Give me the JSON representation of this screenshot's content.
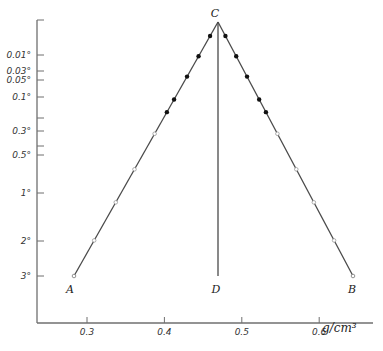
{
  "chart_data": {
    "type": "line",
    "title": "",
    "xlabel": "g/cm³",
    "ylabel": "",
    "xlim": [
      0.235,
      0.67
    ],
    "x_ticks": [
      0.3,
      0.4,
      0.5,
      0.6
    ],
    "x_tick_labels": [
      "0.3",
      "0.4",
      "0.5",
      "0.6"
    ],
    "y_ticks_labeled": [
      {
        "label": "0.01°",
        "value": 0.01
      },
      {
        "label": "0.03°",
        "value": 0.03
      },
      {
        "label": "0.05°",
        "value": 0.05
      },
      {
        "label": "0.1°",
        "value": 0.1
      },
      {
        "label": "0.3°",
        "value": 0.3
      },
      {
        "label": "0.5°",
        "value": 0.5
      },
      {
        "label": "1°",
        "value": 1
      },
      {
        "label": "2°",
        "value": 2
      },
      {
        "label": "3°",
        "value": 3
      }
    ],
    "y_axis_inverted": true,
    "grid": false,
    "points": {
      "A": {
        "label": "A",
        "x": 0.283,
        "y": 3
      },
      "B": {
        "label": "B",
        "x": 0.663,
        "y": 3
      },
      "C": {
        "label": "C",
        "x": 0.47,
        "y": 0.0
      },
      "D": {
        "label": "D",
        "x": 0.47,
        "y": 3
      }
    },
    "series": [
      {
        "name": "A–C (left branch)",
        "from": "A",
        "to": "C"
      },
      {
        "name": "C–B (right branch)",
        "from": "C",
        "to": "B"
      },
      {
        "name": "C–D (vertical)",
        "from": "C",
        "to": "D"
      }
    ],
    "markers": {
      "filled": [
        {
          "branch": "left",
          "frac": 0.055
        },
        {
          "branch": "left",
          "frac": 0.135
        },
        {
          "branch": "left",
          "frac": 0.215
        },
        {
          "branch": "left",
          "frac": 0.305
        },
        {
          "branch": "left",
          "frac": 0.355
        },
        {
          "branch": "right",
          "frac": 0.055
        },
        {
          "branch": "right",
          "frac": 0.135
        },
        {
          "branch": "right",
          "frac": 0.215
        },
        {
          "branch": "right",
          "frac": 0.305
        },
        {
          "branch": "right",
          "frac": 0.355
        }
      ],
      "open": [
        {
          "branch": "left",
          "frac": 0.44
        },
        {
          "branch": "left",
          "frac": 0.58
        },
        {
          "branch": "left",
          "frac": 0.71
        },
        {
          "branch": "left",
          "frac": 0.86
        },
        {
          "branch": "right",
          "frac": 0.44
        },
        {
          "branch": "right",
          "frac": 0.58
        },
        {
          "branch": "right",
          "frac": 0.71
        },
        {
          "branch": "right",
          "frac": 0.86
        }
      ]
    }
  }
}
